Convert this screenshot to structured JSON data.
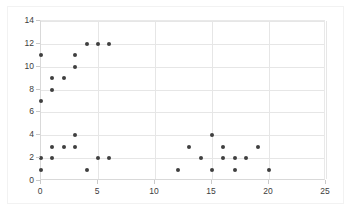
{
  "chart_data": {
    "type": "scatter",
    "title": "",
    "xlabel": "",
    "ylabel": "",
    "xlim": [
      0,
      25
    ],
    "ylim": [
      0,
      14
    ],
    "xticks": [
      0,
      5,
      10,
      15,
      20,
      25
    ],
    "yticks": [
      0,
      2,
      4,
      6,
      8,
      10,
      12,
      14
    ],
    "grid": true,
    "legend": "none",
    "marker_color": "#3f3f3f",
    "grid_color": "#e6e6e6",
    "axis_color": "#d9d9d9",
    "background_color": "#ffffff",
    "series": [
      {
        "name": "series-1",
        "points": [
          [
            0,
            1
          ],
          [
            0,
            2
          ],
          [
            0,
            7
          ],
          [
            0,
            11
          ],
          [
            1,
            2
          ],
          [
            1,
            3
          ],
          [
            1,
            8
          ],
          [
            1,
            9
          ],
          [
            2,
            3
          ],
          [
            2,
            9
          ],
          [
            3,
            3
          ],
          [
            3,
            4
          ],
          [
            3,
            10
          ],
          [
            3,
            11
          ],
          [
            4,
            1
          ],
          [
            4,
            12
          ],
          [
            5,
            2
          ],
          [
            5,
            12
          ],
          [
            6,
            2
          ],
          [
            6,
            12
          ],
          [
            12,
            1
          ],
          [
            13,
            3
          ],
          [
            14,
            2
          ],
          [
            15,
            1
          ],
          [
            15,
            4
          ],
          [
            16,
            2
          ],
          [
            16,
            3
          ],
          [
            17,
            1
          ],
          [
            17,
            2
          ],
          [
            18,
            2
          ],
          [
            19,
            3
          ],
          [
            20,
            1
          ]
        ]
      }
    ]
  },
  "axes": {
    "y_tick_labels": [
      "0",
      "2",
      "4",
      "6",
      "8",
      "10",
      "12",
      "14"
    ],
    "x_tick_labels": [
      "0",
      "5",
      "10",
      "15",
      "20",
      "25"
    ]
  }
}
